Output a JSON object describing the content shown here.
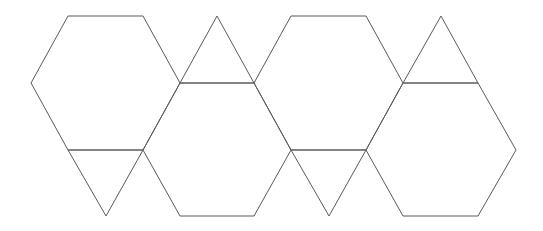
{
  "diagram": {
    "title": "",
    "stroke_color": "#5a5a5a",
    "stroke_width": 1,
    "background": "#ffffff",
    "shapes": [
      {
        "id": "hexagon-1",
        "type": "hexagon",
        "points": "68,16 143,16 180,83 143,150 68,150 31,83"
      },
      {
        "id": "hexagon-2",
        "type": "hexagon",
        "points": "180,83 254,83 291,150 254,216 180,216 143,150"
      },
      {
        "id": "hexagon-3",
        "type": "hexagon",
        "points": "291,16 366,16 403,83 366,150 291,150 254,83"
      },
      {
        "id": "hexagon-4",
        "type": "hexagon",
        "points": "403,83 478,83 516,150 478,216 403,216 366,150"
      },
      {
        "id": "triangle-up-1",
        "type": "triangle",
        "points": "180,83 217,16 254,83"
      },
      {
        "id": "triangle-up-2",
        "type": "triangle",
        "points": "403,83 441,16 478,83"
      },
      {
        "id": "triangle-down-1",
        "type": "triangle",
        "points": "68,150 106,216 143,150"
      },
      {
        "id": "triangle-down-2",
        "type": "triangle",
        "points": "291,150 329,216 366,150"
      }
    ]
  }
}
